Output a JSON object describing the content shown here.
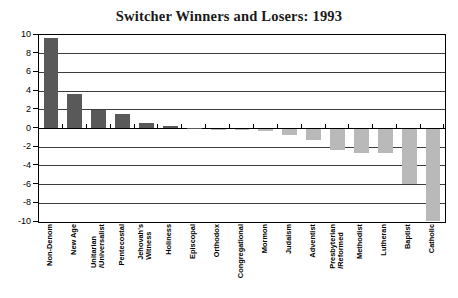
{
  "chart_data": {
    "type": "bar",
    "title": "Switcher Winners and Losers: 1993",
    "xlabel": "",
    "ylabel": "",
    "ylim": [
      -10,
      10
    ],
    "yticks": [
      10,
      8,
      6,
      4,
      2,
      0,
      -2,
      -4,
      -6,
      -8,
      -10
    ],
    "ytick_labels": [
      "10",
      "8",
      "6",
      "4",
      "2",
      "0",
      "-2",
      "-4",
      "-6",
      "-8",
      "-10"
    ],
    "grid": true,
    "legend": "none",
    "positive_color": "#595959",
    "negative_color": "#b9b9b9",
    "categories": [
      "Non-Denom",
      "New Age",
      "Unitarian\n/Universalist",
      "Pentecostal",
      "Jehovah's\nWitness",
      "Holiness",
      "Episcopal",
      "Orthodox",
      "Congregational",
      "Mormon",
      "Judaism",
      "Adventist",
      "Presbyterian\n/Reformed",
      "Methodist",
      "Lutheran",
      "Baptist",
      "Catholic"
    ],
    "values": [
      9.7,
      3.7,
      2.0,
      1.6,
      0.6,
      0.25,
      0.1,
      -0.1,
      -0.2,
      -0.3,
      -0.7,
      -1.2,
      -2.3,
      -2.6,
      -2.6,
      -5.9,
      -9.9
    ]
  }
}
